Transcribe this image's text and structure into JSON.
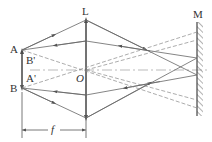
{
  "diagram": {
    "labels": {
      "lens": "L",
      "mirror": "M",
      "pointA": "A",
      "pointB": "B",
      "imageA": "A'",
      "imageB": "B'",
      "center": "O",
      "focal": "f"
    },
    "colors": {
      "line": "#555555",
      "axis": "#999999",
      "text": "#333333"
    }
  }
}
